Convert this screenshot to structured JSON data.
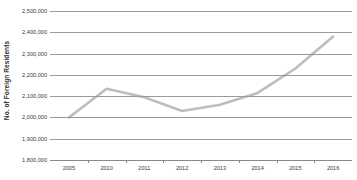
{
  "chart_data": {
    "type": "line",
    "title": "",
    "subtitle": "",
    "xlabel": "",
    "ylabel": "No. of Foreign Residents",
    "categories": [
      "2005",
      "2010",
      "2011",
      "2012",
      "2013",
      "2014",
      "2015",
      "2016"
    ],
    "x": [
      2005,
      2010,
      2011,
      2012,
      2013,
      2014,
      2015,
      2016
    ],
    "series": [
      {
        "name": "No. of Foreign Residents",
        "color": "#bdbdbd",
        "values": [
          2000000,
          2135000,
          2095000,
          2030000,
          2060000,
          2115000,
          2230000,
          2380000
        ]
      }
    ],
    "ylim": [
      1800000,
      2500000
    ],
    "ytick_values": [
      2500000,
      2400000,
      2300000,
      2200000,
      2100000,
      2000000,
      1900000,
      1800000
    ],
    "ytick_labels": [
      "2,500,000",
      "2,400,000",
      "2,300,000",
      "2,200,000",
      "2,100,000",
      "2,000,000",
      "1,900,000",
      "1,800,000"
    ],
    "xtick_labels": [
      "2005",
      "2010",
      "2011",
      "2012",
      "2013",
      "2014",
      "2015",
      "2016"
    ],
    "grid": true,
    "grid_color": "#9a9a9a",
    "legend": false,
    "legend_position": "none",
    "background": "#ffffff"
  }
}
